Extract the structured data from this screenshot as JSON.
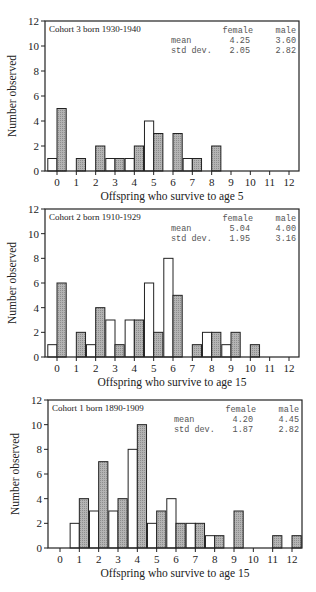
{
  "figure": {
    "panels": [
      {
        "id": "cohort3",
        "cohort_label": "Cohort 3 born 1930-1940",
        "xlabel": "Offspring who survive to age 5",
        "ylabel": "Number observed",
        "stats": {
          "header": [
            "female",
            "male"
          ],
          "rows": [
            {
              "label": "mean",
              "female": "4.25",
              "male": "3.60"
            },
            {
              "label": "std dev.",
              "female": "2.05",
              "male": "2.82"
            }
          ]
        },
        "frame": {
          "left": 45,
          "top": 21,
          "right": 299,
          "bottom": 171
        }
      },
      {
        "id": "cohort2",
        "cohort_label": "Cohort 2 born 1910-1929",
        "xlabel": "Offspring who survive to age 15",
        "ylabel": "Number observed",
        "stats": {
          "header": [
            "female",
            "male"
          ],
          "rows": [
            {
              "label": "mean",
              "female": "5.04",
              "male": "4.00"
            },
            {
              "label": "std dev.",
              "female": "1.95",
              "male": "3.16"
            }
          ]
        },
        "frame": {
          "left": 45,
          "top": 209,
          "right": 299,
          "bottom": 357
        }
      },
      {
        "id": "cohort1",
        "cohort_label": "Cohort 1 born 1890-1909",
        "xlabel": "Offspring who survive to age 15",
        "ylabel": "Number observed",
        "stats": {
          "header": [
            "female",
            "male"
          ],
          "rows": [
            {
              "label": "mean",
              "female": "4.20",
              "male": "4.45"
            },
            {
              "label": "std dev.",
              "female": "1.87",
              "male": "2.82"
            }
          ]
        },
        "frame": {
          "left": 48,
          "top": 400,
          "right": 302,
          "bottom": 548
        }
      }
    ],
    "colors": {
      "female_fill": "#ffffff",
      "male_fill": "#ababab",
      "stroke": "#222222",
      "stats_text": "#555555"
    }
  },
  "chart_data": [
    {
      "type": "bar",
      "title": "Cohort 3 born 1930-1940",
      "xlabel": "Offspring who survive to age 5",
      "ylabel": "Number observed",
      "categories": [
        0,
        1,
        2,
        3,
        4,
        5,
        6,
        7,
        8,
        9,
        10,
        11,
        12
      ],
      "series": [
        {
          "name": "female",
          "values": [
            1,
            0,
            0,
            1,
            1,
            4,
            0,
            1,
            0,
            0,
            0,
            0,
            0
          ]
        },
        {
          "name": "male",
          "values": [
            5,
            1,
            2,
            1,
            2,
            3,
            3,
            1,
            2,
            0,
            0,
            0,
            0
          ]
        }
      ],
      "yticks": [
        0,
        2,
        4,
        6,
        8,
        10,
        12
      ],
      "ylim": [
        0,
        12
      ],
      "grid": false,
      "annotation": {
        "female": {
          "mean": 4.25,
          "std_dev": 2.05
        },
        "male": {
          "mean": 3.6,
          "std_dev": 2.82
        }
      }
    },
    {
      "type": "bar",
      "title": "Cohort 2 born 1910-1929",
      "xlabel": "Offspring who survive to age 15",
      "ylabel": "Number observed",
      "categories": [
        0,
        1,
        2,
        3,
        4,
        5,
        6,
        7,
        8,
        9,
        10,
        11,
        12
      ],
      "series": [
        {
          "name": "female",
          "values": [
            1,
            0,
            1,
            3,
            3,
            6,
            8,
            0,
            2,
            1,
            0,
            0,
            0
          ]
        },
        {
          "name": "male",
          "values": [
            6,
            2,
            4,
            1,
            3,
            2,
            5,
            1,
            2,
            2,
            1,
            0,
            0
          ]
        }
      ],
      "yticks": [
        0,
        2,
        4,
        6,
        8,
        10,
        12
      ],
      "ylim": [
        0,
        12
      ],
      "grid": false,
      "annotation": {
        "female": {
          "mean": 5.04,
          "std_dev": 1.95
        },
        "male": {
          "mean": 4.0,
          "std_dev": 3.16
        }
      }
    },
    {
      "type": "bar",
      "title": "Cohort 1 born 1890-1909",
      "xlabel": "Offspring who survive to age 15",
      "ylabel": "Number observed",
      "categories": [
        0,
        1,
        2,
        3,
        4,
        5,
        6,
        7,
        8,
        9,
        10,
        11,
        12
      ],
      "series": [
        {
          "name": "female",
          "values": [
            0,
            2,
            3,
            3,
            8,
            2,
            4,
            2,
            1,
            0,
            0,
            0,
            0
          ]
        },
        {
          "name": "male",
          "values": [
            0,
            4,
            7,
            4,
            10,
            3,
            2,
            2,
            1,
            3,
            0,
            1,
            1
          ]
        }
      ],
      "yticks": [
        0,
        2,
        4,
        6,
        8,
        10,
        12
      ],
      "ylim": [
        0,
        12
      ],
      "grid": false,
      "annotation": {
        "female": {
          "mean": 4.2,
          "std_dev": 1.87
        },
        "male": {
          "mean": 4.45,
          "std_dev": 2.82
        }
      }
    }
  ]
}
